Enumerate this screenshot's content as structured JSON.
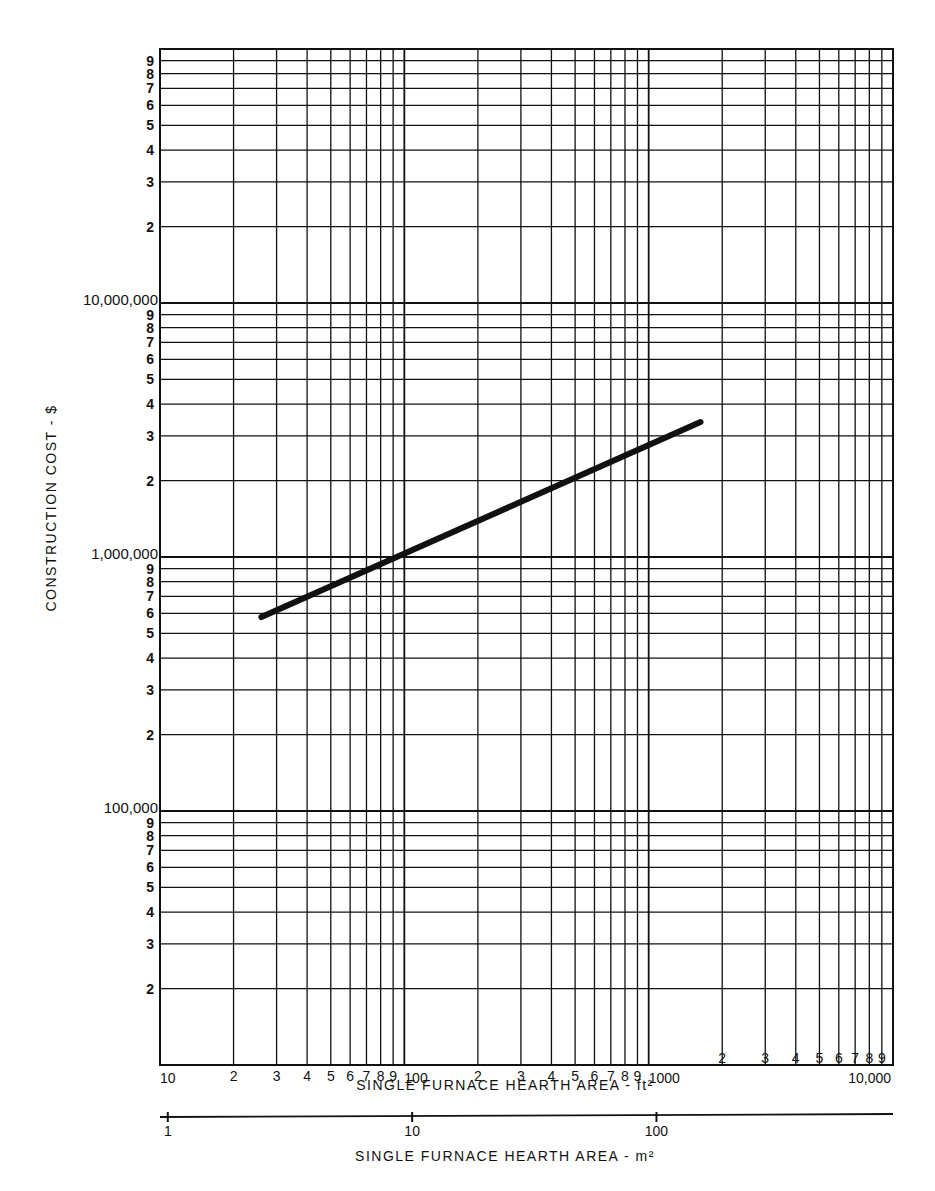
{
  "chart_data": {
    "type": "line",
    "title": "",
    "xlabel": "SINGLE FURNACE HEARTH AREA - ft²",
    "xlabel_secondary": "SINGLE FURNACE HEARTH AREA - m²",
    "ylabel": "CONSTRUCTION COST - $",
    "xscale": "log",
    "yscale": "log",
    "xlim": [
      10,
      10000
    ],
    "ylim": [
      10000,
      100000000
    ],
    "grid": true,
    "x_decade_labels": [
      "10",
      "100",
      "1000",
      "10,000"
    ],
    "x_minor_labels": [
      "2",
      "3",
      "4",
      "5",
      "6",
      "7",
      "8",
      "9"
    ],
    "y_decade_labels": [
      {
        "value": 100000,
        "label": "100,000"
      },
      {
        "value": 1000000,
        "label": "1,000,000"
      },
      {
        "value": 10000000,
        "label": "10,000,000"
      }
    ],
    "y_minor_labels": [
      "2",
      "3",
      "4",
      "5",
      "6",
      "7",
      "8",
      "9"
    ],
    "secondary_x_axis": {
      "unit": "m²",
      "ticks": [
        {
          "value": 1,
          "label": "1"
        },
        {
          "value": 10,
          "label": "10"
        },
        {
          "value": 100,
          "label": "100"
        }
      ]
    },
    "series": [
      {
        "name": "Construction cost",
        "x": [
          26,
          1630
        ],
        "y": [
          580000,
          3400000
        ]
      }
    ]
  }
}
